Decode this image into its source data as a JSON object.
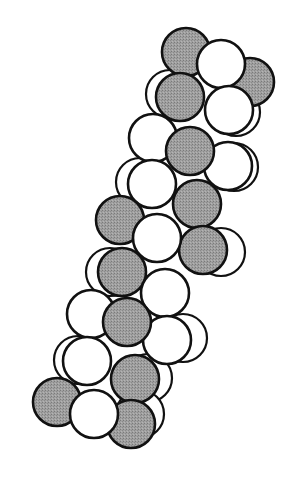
{
  "diagram": {
    "title": "",
    "colors": {
      "gray": "#9a9a9a",
      "white": "#ffffff",
      "stroke": "#111111",
      "background": "#ffffff"
    },
    "radius": 24,
    "back_spheres": [
      {
        "cx": 170,
        "cy": 94,
        "fill": "white"
      },
      {
        "cx": 236,
        "cy": 112,
        "fill": "white"
      },
      {
        "cx": 140,
        "cy": 182,
        "fill": "white"
      },
      {
        "cx": 234,
        "cy": 167,
        "fill": "white"
      },
      {
        "cx": 221,
        "cy": 252,
        "fill": "white"
      },
      {
        "cx": 110,
        "cy": 272,
        "fill": "white"
      },
      {
        "cx": 183,
        "cy": 338,
        "fill": "white"
      },
      {
        "cx": 78,
        "cy": 360,
        "fill": "white"
      },
      {
        "cx": 148,
        "cy": 378,
        "fill": "white"
      },
      {
        "cx": 140,
        "cy": 414,
        "fill": "white"
      }
    ],
    "spheres": [
      {
        "cx": 250,
        "cy": 82,
        "fill": "gray"
      },
      {
        "cx": 186,
        "cy": 52,
        "fill": "gray"
      },
      {
        "cx": 221,
        "cy": 64,
        "fill": "white"
      },
      {
        "cx": 229,
        "cy": 110,
        "fill": "white"
      },
      {
        "cx": 180,
        "cy": 97,
        "fill": "gray"
      },
      {
        "cx": 228,
        "cy": 166,
        "fill": "white"
      },
      {
        "cx": 153,
        "cy": 138,
        "fill": "white"
      },
      {
        "cx": 190,
        "cy": 151,
        "fill": "gray"
      },
      {
        "cx": 197,
        "cy": 204,
        "fill": "gray"
      },
      {
        "cx": 152,
        "cy": 184,
        "fill": "white"
      },
      {
        "cx": 203,
        "cy": 250,
        "fill": "gray"
      },
      {
        "cx": 120,
        "cy": 220,
        "fill": "gray"
      },
      {
        "cx": 157,
        "cy": 238,
        "fill": "white"
      },
      {
        "cx": 122,
        "cy": 272,
        "fill": "gray"
      },
      {
        "cx": 165,
        "cy": 293,
        "fill": "white"
      },
      {
        "cx": 167,
        "cy": 340,
        "fill": "white"
      },
      {
        "cx": 91,
        "cy": 314,
        "fill": "white"
      },
      {
        "cx": 127,
        "cy": 322,
        "fill": "gray"
      },
      {
        "cx": 87,
        "cy": 361,
        "fill": "white"
      },
      {
        "cx": 135,
        "cy": 379,
        "fill": "gray"
      },
      {
        "cx": 57,
        "cy": 402,
        "fill": "gray"
      },
      {
        "cx": 131,
        "cy": 424,
        "fill": "gray"
      },
      {
        "cx": 94,
        "cy": 414,
        "fill": "white"
      }
    ]
  }
}
